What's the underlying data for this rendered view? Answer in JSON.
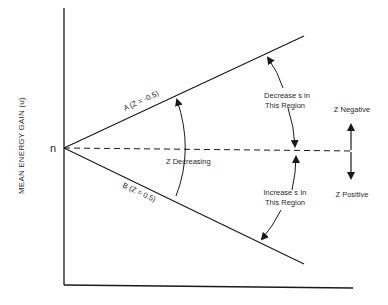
{
  "diagram": {
    "y_axis_label": "MEAN ENERGY GAIN (u)",
    "origin_label": "n",
    "line_a_label": "A (Z = -0.5)",
    "line_b_label": "B (Z = 0.5)",
    "center_label": "Z Decreasing",
    "upper_region_label_line1": "Decrease s in",
    "upper_region_label_line2": "This Region",
    "lower_region_label_line1": "Increase s In",
    "lower_region_label_line2": "This Region",
    "z_negative_label": "Z Negative",
    "z_positive_label": "Z Positive",
    "colors": {
      "line": "#1a1a1a",
      "text": "#2a2a2a",
      "background": "#ffffff"
    }
  }
}
